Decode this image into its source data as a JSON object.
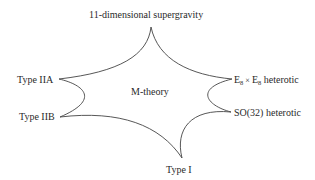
{
  "diagram": {
    "center_label": "M-theory",
    "nodes": [
      {
        "id": "top",
        "label": "11-dimensional supergravity",
        "cusp": [
          151,
          27
        ]
      },
      {
        "id": "iia",
        "label": "Type IIA",
        "cusp": [
          59,
          79
        ]
      },
      {
        "id": "iib",
        "label": "Type IIB",
        "cusp": [
          60,
          117
        ]
      },
      {
        "id": "type1",
        "label": "Type I",
        "cusp": [
          182,
          158
        ]
      },
      {
        "id": "so32",
        "label": "SO(32) heterotic",
        "cusp": [
          231,
          112
        ]
      },
      {
        "id": "e8",
        "label_parts": {
          "base1": "E",
          "sub1": "8",
          "times": "×",
          "base2": "E",
          "sub2": "8",
          "suffix": "heterotic"
        },
        "cusp": [
          232,
          79
        ]
      }
    ],
    "stroke_color": "#444444",
    "text_color": "#2a2a2a"
  }
}
